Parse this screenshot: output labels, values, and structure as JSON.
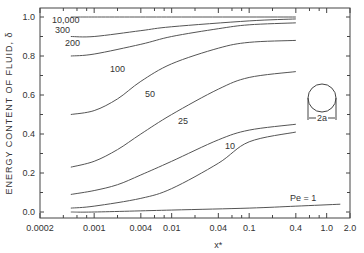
{
  "chart_data": {
    "type": "line",
    "title": "",
    "xlabel": "x*",
    "ylabel": "ENERGY CONTENT OF FLUID, δ",
    "xscale": "log",
    "xlim": [
      0.0002,
      2.0
    ],
    "ylim": [
      0.0,
      1.0
    ],
    "x_ticks": [
      "0.0002",
      "0.001",
      "0.004",
      "0.01",
      "0.04",
      "0.1",
      "0.4",
      "1.0",
      "2.0"
    ],
    "y_ticks": [
      "0.0",
      "0.2",
      "0.4",
      "0.6",
      "0.8",
      "1.0"
    ],
    "grid": false,
    "legend": "inline curve labels",
    "inset_label": "2a",
    "series": [
      {
        "name": "10,000",
        "x": [
          0.0005,
          0.001,
          0.01,
          0.1,
          0.4
        ],
        "y": [
          1.0,
          1.0,
          1.0,
          1.0,
          1.0
        ]
      },
      {
        "name": "300",
        "x": [
          0.0005,
          0.001,
          0.004,
          0.01,
          0.1,
          0.4
        ],
        "y": [
          0.9,
          0.9,
          0.93,
          0.95,
          0.98,
          0.99
        ]
      },
      {
        "name": "200",
        "x": [
          0.0005,
          0.001,
          0.004,
          0.01,
          0.04,
          0.1,
          0.4
        ],
        "y": [
          0.8,
          0.81,
          0.86,
          0.9,
          0.94,
          0.96,
          0.97
        ]
      },
      {
        "name": "100",
        "x": [
          0.0005,
          0.001,
          0.002,
          0.004,
          0.01,
          0.04,
          0.1,
          0.4
        ],
        "y": [
          0.5,
          0.52,
          0.58,
          0.67,
          0.76,
          0.84,
          0.87,
          0.88
        ]
      },
      {
        "name": "50",
        "x": [
          0.0005,
          0.001,
          0.002,
          0.004,
          0.01,
          0.04,
          0.1,
          0.4
        ],
        "y": [
          0.23,
          0.26,
          0.32,
          0.4,
          0.5,
          0.63,
          0.69,
          0.72
        ]
      },
      {
        "name": "25",
        "x": [
          0.0005,
          0.001,
          0.002,
          0.004,
          0.01,
          0.04,
          0.1,
          0.4
        ],
        "y": [
          0.09,
          0.11,
          0.14,
          0.19,
          0.26,
          0.37,
          0.42,
          0.45
        ]
      },
      {
        "name": "10",
        "x": [
          0.0005,
          0.001,
          0.004,
          0.01,
          0.04,
          0.1,
          0.4
        ],
        "y": [
          0.02,
          0.03,
          0.07,
          0.12,
          0.25,
          0.36,
          0.41
        ]
      },
      {
        "name": "Pe = 1",
        "x": [
          0.0005,
          0.001,
          0.01,
          0.1,
          0.4,
          1.5
        ],
        "y": [
          0.0,
          0.0,
          0.01,
          0.02,
          0.03,
          0.04
        ]
      }
    ]
  },
  "labels": {
    "ylabel": "ENERGY CONTENT OF FLUID, δ",
    "xlabel": "x*",
    "inset": "2a"
  }
}
